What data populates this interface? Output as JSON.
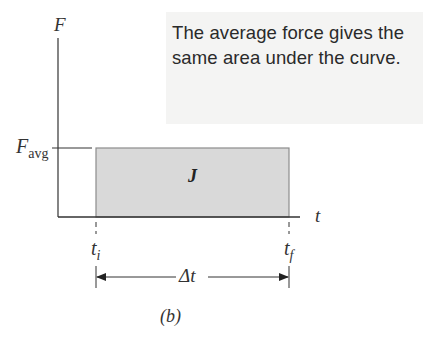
{
  "figure": {
    "panel_label": "(b)",
    "callout_text": "The average force gives the same area under the curve."
  },
  "axes": {
    "y_label": "F",
    "x_label": "t"
  },
  "annotations": {
    "f_avg_main": "F",
    "f_avg_sub": "avg",
    "area_label": "J",
    "t_initial_main": "t",
    "t_initial_sub": "i",
    "t_final_main": "t",
    "t_final_sub": "f",
    "duration_label": "Δt"
  },
  "colors": {
    "rect_fill": "#d9d9d9",
    "rect_border": "#8c8c8c",
    "axis": "#333333",
    "callout_bg": "#f4f4f3"
  }
}
